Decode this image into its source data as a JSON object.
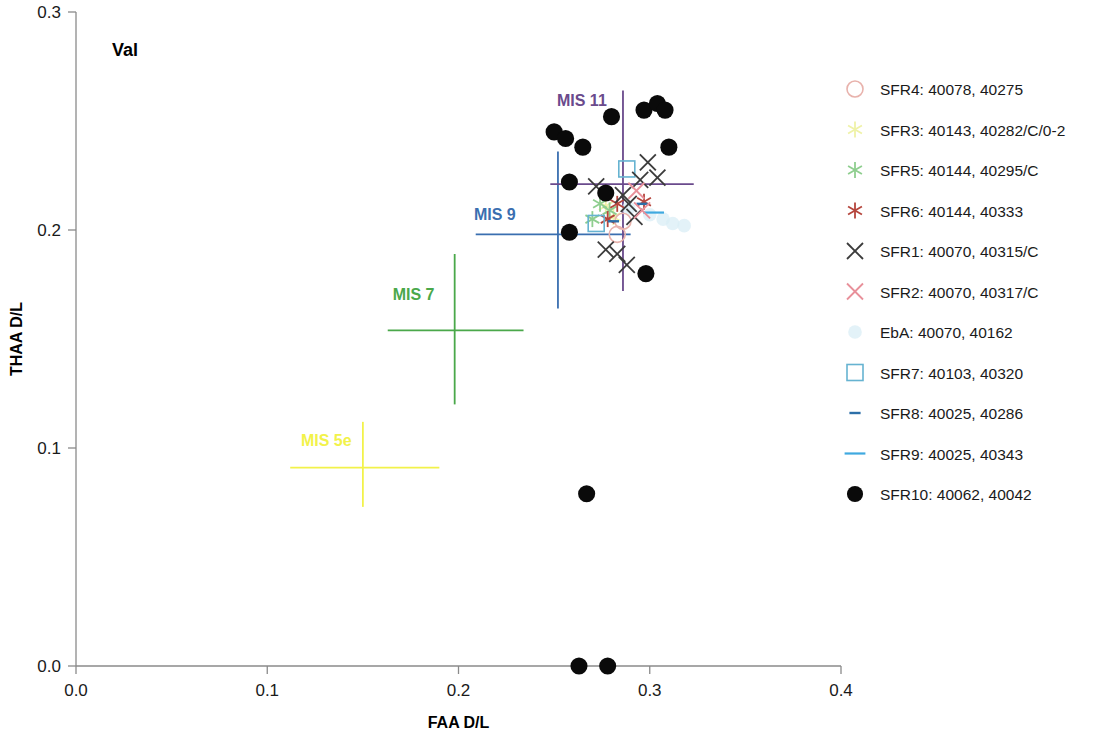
{
  "chart_data": {
    "type": "scatter",
    "title": "Val",
    "xlabel": "FAA D/L",
    "ylabel": "THAA D/L",
    "xlim": [
      0.0,
      0.4
    ],
    "ylim": [
      0.0,
      0.3
    ],
    "xticks": [
      0.0,
      0.1,
      0.2,
      0.3,
      0.4
    ],
    "xtick_labels": [
      "0.0",
      "0.1",
      "0.2",
      "0.3",
      "0.4"
    ],
    "yticks": [
      0.0,
      0.1,
      0.2,
      0.3
    ],
    "ytick_labels": [
      "0.0",
      "0.1",
      "0.2",
      "0.3"
    ],
    "grid": false,
    "legend_position": "right",
    "series": [
      {
        "name": "SFR4: 40078, 40275",
        "marker": "open-circle",
        "color": "#e8b2ac",
        "points": [
          [
            0.283,
            0.198
          ],
          [
            0.286,
            0.204
          ]
        ]
      },
      {
        "name": "SFR3: 40143, 40282/C/0-2",
        "marker": "asterisk",
        "color": "#eff2a8",
        "points": [
          [
            0.277,
            0.211
          ],
          [
            0.281,
            0.206
          ]
        ]
      },
      {
        "name": "SFR5: 40144, 40295/C",
        "marker": "asterisk",
        "color": "#8fce8f",
        "points": [
          [
            0.274,
            0.212
          ],
          [
            0.27,
            0.205
          ],
          [
            0.279,
            0.209
          ]
        ]
      },
      {
        "name": "SFR6: 40144, 40333",
        "marker": "asterisk",
        "color": "#b5453c",
        "points": [
          [
            0.283,
            0.212
          ],
          [
            0.278,
            0.205
          ],
          [
            0.297,
            0.213
          ]
        ]
      },
      {
        "name": "SFR1: 40070, 40315/C",
        "marker": "cross-x",
        "color": "#3b3b3b",
        "points": [
          [
            0.272,
            0.22
          ],
          [
            0.286,
            0.216
          ],
          [
            0.289,
            0.212
          ],
          [
            0.295,
            0.223
          ],
          [
            0.304,
            0.224
          ],
          [
            0.277,
            0.191
          ],
          [
            0.283,
            0.189
          ],
          [
            0.288,
            0.184
          ],
          [
            0.299,
            0.231
          ],
          [
            0.292,
            0.206
          ]
        ]
      },
      {
        "name": "SFR2: 40070, 40317/C",
        "marker": "cross-x",
        "color": "#e8909a",
        "points": [
          [
            0.293,
            0.218
          ],
          [
            0.296,
            0.209
          ]
        ]
      },
      {
        "name": "EbA: 40070, 40162",
        "marker": "dot-faint",
        "color": "#d9eef5",
        "points": [
          [
            0.3,
            0.207
          ],
          [
            0.307,
            0.205
          ],
          [
            0.312,
            0.203
          ],
          [
            0.318,
            0.202
          ],
          [
            0.289,
            0.21
          ]
        ]
      },
      {
        "name": "SFR7: 40103, 40320",
        "marker": "open-square",
        "color": "#66b3d1",
        "points": [
          [
            0.288,
            0.228
          ],
          [
            0.272,
            0.203
          ]
        ]
      },
      {
        "name": "SFR8: 40025, 40286",
        "marker": "short-dash",
        "color": "#2c6fa8",
        "points": [
          [
            0.296,
            0.212
          ],
          [
            0.281,
            0.204
          ]
        ]
      },
      {
        "name": "SFR9: 40025, 40343",
        "marker": "long-dash",
        "color": "#3fa9e0",
        "points": [
          [
            0.302,
            0.208
          ]
        ]
      },
      {
        "name": "SFR10: 40062, 40042",
        "marker": "filled-circle",
        "color": "#0a0a0a",
        "points": [
          [
            0.263,
            0.0
          ],
          [
            0.278,
            0.0
          ],
          [
            0.267,
            0.079
          ],
          [
            0.298,
            0.18
          ],
          [
            0.258,
            0.199
          ],
          [
            0.258,
            0.222
          ],
          [
            0.265,
            0.238
          ],
          [
            0.25,
            0.245
          ],
          [
            0.256,
            0.242
          ],
          [
            0.28,
            0.252
          ],
          [
            0.297,
            0.255
          ],
          [
            0.304,
            0.258
          ],
          [
            0.308,
            0.255
          ],
          [
            0.31,
            0.238
          ],
          [
            0.277,
            0.217
          ]
        ]
      }
    ],
    "reference_markers": [
      {
        "label": "MIS 5e",
        "color": "#f2f24a",
        "x": 0.15,
        "y": 0.091,
        "x_err_low": 0.112,
        "x_err_high": 0.19,
        "y_err_low": 0.073,
        "y_err_high": 0.112
      },
      {
        "label": "MIS 7",
        "color": "#4aa84a",
        "x": 0.198,
        "y": 0.154,
        "x_err_low": 0.163,
        "x_err_high": 0.234,
        "y_err_low": 0.12,
        "y_err_high": 0.189
      },
      {
        "label": "MIS 9",
        "color": "#3a6fb0",
        "x": 0.252,
        "y": 0.198,
        "x_err_low": 0.209,
        "x_err_high": 0.29,
        "y_err_low": 0.164,
        "y_err_high": 0.236
      },
      {
        "label": "MIS 11",
        "color": "#6a4a8c",
        "x": 0.286,
        "y": 0.221,
        "x_err_low": 0.248,
        "x_err_high": 0.323,
        "y_err_low": 0.172,
        "y_err_high": 0.264
      }
    ]
  },
  "legend": {
    "items": [
      {
        "label": "SFR4: 40078, 40275",
        "marker": "open-circle",
        "color": "#e8b2ac"
      },
      {
        "label": "SFR3: 40143, 40282/C/0-2",
        "marker": "asterisk",
        "color": "#eff2a8"
      },
      {
        "label": "SFR5: 40144, 40295/C",
        "marker": "asterisk",
        "color": "#8fce8f"
      },
      {
        "label": "SFR6: 40144, 40333",
        "marker": "asterisk",
        "color": "#b5453c"
      },
      {
        "label": "SFR1: 40070, 40315/C",
        "marker": "cross-x",
        "color": "#3b3b3b"
      },
      {
        "label": "SFR2: 40070, 40317/C",
        "marker": "cross-x",
        "color": "#e8909a"
      },
      {
        "label": "EbA: 40070, 40162",
        "marker": "dot-faint",
        "color": "#d9eef5"
      },
      {
        "label": "SFR7: 40103, 40320",
        "marker": "open-square",
        "color": "#66b3d1"
      },
      {
        "label": "SFR8: 40025, 40286",
        "marker": "short-dash",
        "color": "#2c6fa8"
      },
      {
        "label": "SFR9: 40025, 40343",
        "marker": "long-dash",
        "color": "#3fa9e0"
      },
      {
        "label": "SFR10: 40062, 40042",
        "marker": "filled-circle",
        "color": "#0a0a0a"
      }
    ]
  }
}
